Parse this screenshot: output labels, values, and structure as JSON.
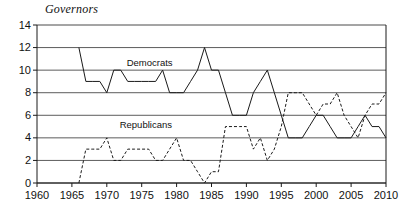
{
  "chart_data": {
    "type": "line",
    "title": "Governors",
    "xlabel": "",
    "ylabel": "",
    "xlim": [
      1960,
      2010
    ],
    "ylim": [
      0,
      14
    ],
    "grid": "horizontal",
    "legend_position": "inline-annotations",
    "xticks": [
      1960,
      1965,
      1970,
      1975,
      1980,
      1985,
      1990,
      1995,
      2000,
      2005,
      2010
    ],
    "yticks": [
      0,
      2,
      4,
      6,
      8,
      10,
      12,
      14
    ],
    "xtick_labels": [
      "1960",
      "1965",
      "1970",
      "1975",
      "1980",
      "1985",
      "1990",
      "1995",
      "2000",
      "2005",
      "2010"
    ],
    "ytick_labels": [
      "0",
      "2",
      "4",
      "6",
      "8",
      "10",
      "12",
      "14"
    ],
    "series": [
      {
        "name": "Democrats",
        "style": "solid",
        "color": "#1a1a1a",
        "x": [
          1966,
          1967,
          1968,
          1969,
          1970,
          1971,
          1972,
          1973,
          1974,
          1975,
          1976,
          1977,
          1978,
          1979,
          1980,
          1981,
          1982,
          1983,
          1984,
          1985,
          1986,
          1987,
          1988,
          1989,
          1990,
          1991,
          1992,
          1993,
          1994,
          1995,
          1996,
          1997,
          1998,
          1999,
          2000,
          2001,
          2002,
          2003,
          2004,
          2005,
          2006,
          2007,
          2008,
          2009,
          2010
        ],
        "values": [
          12,
          9,
          9,
          9,
          8,
          10,
          10,
          9,
          9,
          9,
          9,
          9,
          10,
          8,
          8,
          8,
          9,
          10,
          12,
          10,
          10,
          8,
          6,
          6,
          6,
          8,
          9,
          10,
          8,
          6,
          4,
          4,
          4,
          5,
          6,
          6,
          5,
          4,
          4,
          4,
          5,
          6,
          5,
          5,
          4
        ]
      },
      {
        "name": "Republicans",
        "style": "dashed",
        "color": "#1a1a1a",
        "x": [
          1966,
          1967,
          1968,
          1969,
          1970,
          1971,
          1972,
          1973,
          1974,
          1975,
          1976,
          1977,
          1978,
          1979,
          1980,
          1981,
          1982,
          1983,
          1984,
          1985,
          1986,
          1987,
          1988,
          1989,
          1990,
          1991,
          1992,
          1993,
          1994,
          1995,
          1996,
          1997,
          1998,
          1999,
          2000,
          2001,
          2002,
          2003,
          2004,
          2005,
          2006,
          2007,
          2008,
          2009,
          2010
        ],
        "values": [
          0,
          3,
          3,
          3,
          4,
          2,
          2,
          3,
          3,
          3,
          3,
          2,
          2,
          3,
          4,
          2,
          2,
          1,
          0,
          1,
          1,
          5,
          5,
          5,
          5,
          3,
          4,
          2,
          3,
          5,
          8,
          8,
          8,
          7,
          6,
          7,
          7,
          8,
          6,
          5,
          4,
          6,
          7,
          7,
          8
        ]
      }
    ],
    "annotations": [
      {
        "text": "Democrats",
        "x": 1976,
        "y": 10.6
      },
      {
        "text": "Republicans",
        "x": 1975,
        "y": 5.1
      }
    ]
  }
}
